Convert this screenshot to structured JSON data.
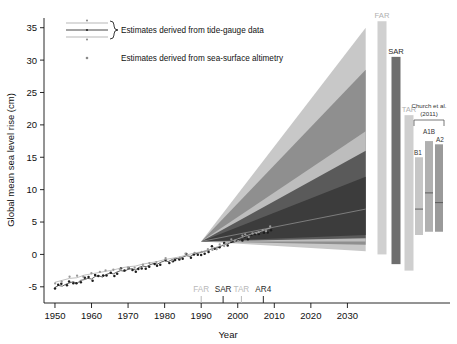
{
  "chart_data": {
    "type": "line",
    "title": "",
    "xlabel": "Year",
    "ylabel": "Global mean sea level rise (cm)",
    "xlim": [
      1947,
      2037
    ],
    "ylim": [
      -7.5,
      36.5
    ],
    "xticks": [
      1950,
      1960,
      1970,
      1980,
      1990,
      2000,
      2010,
      2020,
      2030
    ],
    "yticks": [
      -5,
      0,
      5,
      10,
      15,
      20,
      25,
      30,
      35
    ],
    "grid": false,
    "legend_position": "top-left",
    "legend": [
      {
        "key": "tide-gauge",
        "label": "Estimates derived from tide-gauge data",
        "marker": "line-with-band"
      },
      {
        "key": "altimetry",
        "label": "Estimates derived from sea-surface altimetry",
        "marker": "dot"
      }
    ],
    "report_markers": [
      {
        "label": "FAR",
        "year": 1990,
        "color": "#b9b9b9"
      },
      {
        "label": "SAR",
        "year": 1996,
        "color": "#2b2b2b"
      },
      {
        "label": "TAR",
        "year": 2001,
        "color": "#b9b9b9"
      },
      {
        "label": "AR4",
        "year": 2007,
        "color": "#2b2b2b"
      }
    ],
    "observations": {
      "tide_gauge": {
        "name": "Tide-gauge estimates",
        "x": [
          1950,
          1951,
          1952,
          1953,
          1954,
          1955,
          1956,
          1957,
          1958,
          1959,
          1960,
          1961,
          1962,
          1963,
          1964,
          1965,
          1966,
          1967,
          1968,
          1969,
          1970,
          1971,
          1972,
          1973,
          1974,
          1975,
          1976,
          1977,
          1978,
          1979,
          1980,
          1981,
          1982,
          1983,
          1984,
          1985,
          1986,
          1987,
          1988,
          1989,
          1990,
          1991,
          1992,
          1993,
          1994,
          1995,
          1996,
          1997,
          1998,
          1999,
          2000,
          2001,
          2002,
          2003,
          2004,
          2005,
          2006,
          2007,
          2008,
          2009
        ],
        "y": [
          -5.1,
          -4.8,
          -4.9,
          -4.6,
          -4.4,
          -4.2,
          -4.5,
          -4.0,
          -3.9,
          -3.7,
          -3.8,
          -3.4,
          -3.3,
          -3.5,
          -3.1,
          -2.9,
          -3.0,
          -2.7,
          -2.5,
          -2.6,
          -2.3,
          -2.2,
          -2.4,
          -2.0,
          -1.8,
          -1.9,
          -1.6,
          -1.4,
          -1.5,
          -1.2,
          -1.0,
          -1.1,
          -0.8,
          -0.6,
          -0.7,
          -0.4,
          -0.2,
          -0.3,
          0.0,
          0.2,
          0.3,
          0.5,
          0.6,
          0.9,
          1.0,
          1.2,
          1.4,
          1.6,
          1.8,
          1.9,
          2.1,
          2.3,
          2.5,
          2.6,
          2.8,
          3.0,
          3.1,
          3.3,
          3.4,
          3.6
        ]
      },
      "altimetry": {
        "name": "Sea-surface altimetry estimates",
        "x": [
          1950,
          1952,
          1954,
          1956,
          1958,
          1960,
          1962,
          1964,
          1966,
          1968,
          1970,
          1972,
          1974,
          1976,
          1978,
          1980,
          1982,
          1984,
          1986,
          1988,
          1990,
          1992,
          1993,
          1994,
          1995,
          1996,
          1997,
          1998,
          1999,
          2000,
          2001,
          2002,
          2003,
          2004,
          2005,
          2006,
          2007,
          2008,
          2009
        ],
        "y": [
          -4.3,
          -4.0,
          -3.7,
          -3.6,
          -3.2,
          -3.0,
          -2.8,
          -2.6,
          -2.4,
          -2.1,
          -1.9,
          -1.8,
          -1.5,
          -1.3,
          -1.1,
          -0.8,
          -0.6,
          -0.4,
          -0.1,
          0.2,
          0.4,
          0.7,
          0.9,
          1.1,
          1.3,
          1.5,
          1.7,
          2.0,
          2.2,
          2.4,
          2.6,
          2.8,
          3.0,
          3.2,
          3.4,
          3.5,
          3.7,
          3.9,
          4.1
        ]
      }
    },
    "projection_fan": {
      "origin": {
        "year": 1990,
        "value": 2.0
      },
      "end_year": 2035,
      "wedges": [
        {
          "name": "outer-light",
          "color": "#c8c8c8",
          "upper_2035": 35.0,
          "lower_2035": 0.5
        },
        {
          "name": "mid-gray",
          "color": "#8f8f8f",
          "upper_2035": 28.5,
          "lower_2035": 1.5
        },
        {
          "name": "inner-band",
          "color": "#bdbdbd",
          "upper_2035": 19.0,
          "lower_2035": 2.0
        },
        {
          "name": "dark-core",
          "color": "#5a5a5a",
          "upper_2035": 16.0,
          "lower_2035": 2.5
        },
        {
          "name": "darkest-core",
          "color": "#3c3c3c",
          "upper_2035": 12.0,
          "lower_2035": 3.0
        }
      ]
    },
    "projection_bars": [
      {
        "label": "FAR",
        "x_px": 382,
        "top_value": 36.0,
        "bottom_value": 0.0,
        "color": "#d0d0d0",
        "label_color": "#b0b0b0"
      },
      {
        "label": "SAR",
        "x_px": 396,
        "top_value": 30.5,
        "bottom_value": -1.5,
        "color": "#6e6e6e",
        "label_color": "#2b2b2b"
      },
      {
        "label": "TAR",
        "x_px": 409,
        "top_value": 21.5,
        "bottom_value": -2.5,
        "color": "#cfcfcf",
        "label_color": "#b0b0b0"
      }
    ],
    "church_group": {
      "title_line1": "Church et al.",
      "title_line2": "(2011)",
      "bars": [
        {
          "label": "B1",
          "x_px": 419,
          "top_value": 15.0,
          "bottom_value": 3.0,
          "mid_value": 7.0,
          "color": "#c6c6c6"
        },
        {
          "label": "A1B",
          "x_px": 429,
          "top_value": 17.5,
          "bottom_value": 3.5,
          "mid_value": 9.5,
          "color": "#b0b0b0"
        },
        {
          "label": "A2",
          "x_px": 439,
          "top_value": 17.0,
          "bottom_value": 3.5,
          "mid_value": 8.0,
          "color": "#9a9a9a"
        }
      ]
    }
  }
}
